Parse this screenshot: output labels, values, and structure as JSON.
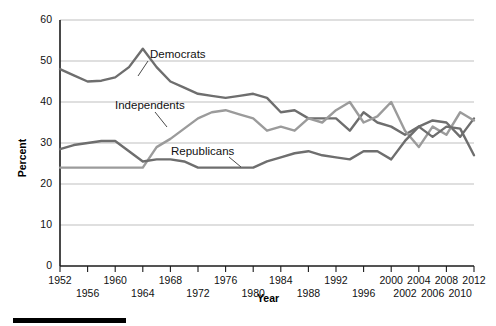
{
  "chart_data": {
    "type": "line",
    "title": "",
    "xlabel": "Year",
    "ylabel": "Percent",
    "xlim": [
      1952,
      2012
    ],
    "ylim": [
      0,
      60
    ],
    "grid": true,
    "legend_position": "inline-annotations",
    "x": [
      1952,
      1954,
      1956,
      1958,
      1960,
      1962,
      1964,
      1966,
      1968,
      1970,
      1972,
      1974,
      1976,
      1978,
      1980,
      1982,
      1984,
      1986,
      1988,
      1990,
      1992,
      1994,
      1996,
      1998,
      2000,
      2002,
      2004,
      2006,
      2008,
      2010,
      2012
    ],
    "xticks_top": [
      "1952",
      "1960",
      "1968",
      "1976",
      "1984",
      "1992",
      "2000",
      "2004",
      "2008",
      "2012"
    ],
    "xticks_bottom": [
      "1956",
      "1964",
      "1972",
      "1980",
      "1988",
      "1996",
      "2002",
      "2006",
      "2010"
    ],
    "xtick_years_top": [
      1952,
      1960,
      1968,
      1976,
      1984,
      1992,
      2000,
      2004,
      2008,
      2012
    ],
    "xtick_years_bottom": [
      1956,
      1964,
      1972,
      1980,
      1988,
      1996,
      2002,
      2006,
      2010
    ],
    "yticks": [
      0,
      10,
      20,
      30,
      40,
      50,
      60
    ],
    "series": [
      {
        "name": "Democrats",
        "color": "#6e6e6e",
        "label_x": 1976,
        "label_y": 52,
        "values": [
          48,
          46.5,
          45,
          45.2,
          46,
          48.5,
          53,
          48.5,
          45,
          43.5,
          42,
          41.5,
          41,
          41.5,
          42,
          41,
          37.5,
          38,
          36,
          36,
          36,
          33,
          37.5,
          35,
          34,
          32,
          34,
          35.5,
          35,
          31.5,
          36
        ]
      },
      {
        "name": "Independents",
        "color": "#9b9b9b",
        "label_x": 1970,
        "label_y": 41.5,
        "values": [
          24,
          24,
          24,
          24,
          24,
          24,
          24,
          29,
          31,
          33.5,
          36,
          37.5,
          38,
          37,
          36,
          33,
          34,
          33,
          36,
          35,
          38,
          40,
          35,
          36.5,
          40,
          33,
          29,
          34,
          32,
          37.5,
          35.5
        ]
      },
      {
        "name": "Republicans",
        "color": "#6e6e6e",
        "label_x": 1974,
        "label_y": 28.5,
        "values": [
          28.5,
          29.5,
          30,
          30.5,
          30.5,
          28,
          25.5,
          26,
          26,
          25.5,
          24,
          24,
          24,
          24,
          24,
          25.5,
          26.5,
          27.5,
          28,
          27,
          26.5,
          26,
          28,
          28,
          26,
          30.5,
          34,
          31.5,
          34,
          33.5,
          27
        ]
      }
    ]
  },
  "axes": {
    "y_title": "Percent",
    "x_title": "Year"
  },
  "footer": {
    "rule": ""
  }
}
